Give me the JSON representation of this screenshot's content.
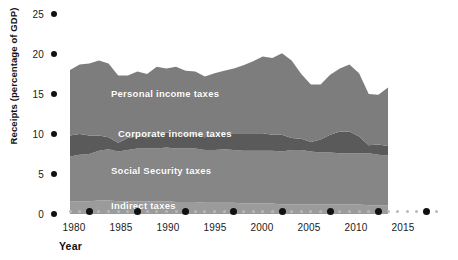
{
  "chart_data": {
    "type": "area",
    "stacked": true,
    "title": "",
    "subtitle": "",
    "xlabel": "Year",
    "ylabel": "Receipts (percentage of GDP)",
    "xlim": [
      1978,
      2016
    ],
    "ylim": [
      0,
      25
    ],
    "yticks": [
      0,
      5,
      10,
      15,
      20,
      25
    ],
    "xticks": [
      1980,
      1985,
      1990,
      1995,
      2000,
      2005,
      2010,
      2015
    ],
    "xtick_labels": [
      "1980",
      "1985",
      "1990",
      "1995",
      "2000",
      "2005",
      "2010",
      "2015"
    ],
    "ytick_labels": [
      "0",
      "5",
      "10",
      "15",
      "20",
      "25"
    ],
    "grid": false,
    "legend": "inline-band-labels",
    "x": [
      1978,
      1979,
      1980,
      1981,
      1982,
      1983,
      1984,
      1985,
      1986,
      1987,
      1988,
      1989,
      1990,
      1991,
      1992,
      1993,
      1994,
      1995,
      1996,
      1997,
      1998,
      1999,
      2000,
      2001,
      2002,
      2003,
      2004,
      2005,
      2006,
      2007,
      2008,
      2009,
      2010,
      2011
    ],
    "series": [
      {
        "name": "Indirect taxes",
        "color": "#9b9b9b",
        "values": [
          1.6,
          1.6,
          1.6,
          1.7,
          1.7,
          1.6,
          1.6,
          1.6,
          1.6,
          1.6,
          1.6,
          1.5,
          1.5,
          1.5,
          1.4,
          1.4,
          1.4,
          1.4,
          1.3,
          1.3,
          1.3,
          1.3,
          1.2,
          1.2,
          1.2,
          1.2,
          1.2,
          1.2,
          1.2,
          1.2,
          1.2,
          1.1,
          1.1,
          1.1
        ]
      },
      {
        "name": "Social Security taxes",
        "color": "#868686",
        "values": [
          5.6,
          5.8,
          5.9,
          6.2,
          6.4,
          6.2,
          6.4,
          6.6,
          6.6,
          6.6,
          6.7,
          6.7,
          6.7,
          6.7,
          6.6,
          6.6,
          6.7,
          6.6,
          6.6,
          6.6,
          6.6,
          6.6,
          6.6,
          6.8,
          6.8,
          6.6,
          6.5,
          6.5,
          6.4,
          6.4,
          6.4,
          6.5,
          6.3,
          6.2
        ]
      },
      {
        "name": "Corporate income taxes",
        "color": "#5a5a5a",
        "values": [
          2.6,
          2.6,
          2.3,
          1.9,
          1.5,
          1.1,
          1.5,
          1.5,
          1.4,
          1.8,
          1.9,
          1.9,
          1.6,
          1.7,
          1.6,
          1.8,
          2.0,
          2.1,
          2.2,
          2.2,
          2.2,
          2.0,
          2.1,
          1.5,
          1.4,
          1.2,
          1.6,
          2.2,
          2.7,
          2.7,
          2.1,
          1.0,
          1.3,
          1.2
        ]
      },
      {
        "name": "Personal income taxes",
        "color": "#7d7d7d",
        "values": [
          8.2,
          8.7,
          9.0,
          9.4,
          9.2,
          8.4,
          7.8,
          8.1,
          7.9,
          8.4,
          8.0,
          8.3,
          8.1,
          7.9,
          7.6,
          7.8,
          7.8,
          8.1,
          8.5,
          9.0,
          9.6,
          9.6,
          10.2,
          9.7,
          8.1,
          7.2,
          6.9,
          7.5,
          7.9,
          8.4,
          7.9,
          6.4,
          6.2,
          7.3
        ]
      }
    ],
    "band_labels": [
      {
        "text": "Personal income taxes",
        "x": 111,
        "y": 88
      },
      {
        "text": "Corporate income taxes",
        "x": 118,
        "y": 128
      },
      {
        "text": "Social Security taxes",
        "x": 111,
        "y": 165
      },
      {
        "text": "Indirect taxes",
        "x": 111,
        "y": 200
      }
    ]
  },
  "colors": {
    "background": "#ffffff",
    "axis_text": "#1a1a1a",
    "axis_dot": "#111111",
    "minor_dot": "#b9b9b9",
    "personal": "#7d7d7d",
    "corporate": "#5a5a5a",
    "social": "#868686",
    "indirect": "#9b9b9b",
    "band_label_text": "#ffffff"
  }
}
